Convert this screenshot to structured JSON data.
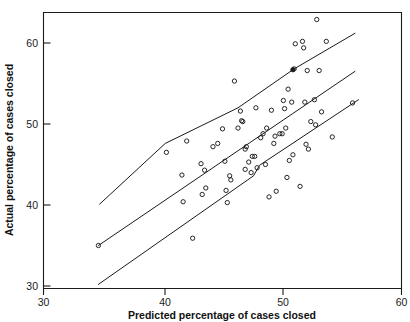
{
  "chart_data": {
    "type": "scatter",
    "title": "",
    "xlabel": "Predicted percentage of cases closed",
    "ylabel": "Actual percentage of cases closed",
    "xlim": [
      30,
      60
    ],
    "ylim": [
      30,
      65
    ],
    "xticks": [
      30,
      40,
      50,
      60
    ],
    "yticks": [
      30,
      40,
      50,
      60
    ],
    "xtick_labels": [
      "30",
      "40",
      "50",
      "60"
    ],
    "ytick_labels": [
      "30",
      "40",
      "50",
      "60"
    ],
    "grid": false,
    "legend": null,
    "marker": "open-circle",
    "points": [
      [
        34.6,
        35.0
      ],
      [
        40.3,
        46.5
      ],
      [
        41.6,
        43.7
      ],
      [
        41.7,
        40.4
      ],
      [
        42.0,
        47.9
      ],
      [
        42.5,
        35.9
      ],
      [
        43.2,
        45.1
      ],
      [
        43.5,
        44.3
      ],
      [
        43.6,
        42.1
      ],
      [
        43.3,
        41.3
      ],
      [
        44.2,
        47.2
      ],
      [
        44.6,
        47.6
      ],
      [
        45.0,
        49.4
      ],
      [
        45.2,
        45.4
      ],
      [
        45.3,
        41.8
      ],
      [
        45.4,
        40.3
      ],
      [
        45.6,
        43.6
      ],
      [
        45.7,
        43.1
      ],
      [
        46.0,
        55.3
      ],
      [
        46.3,
        49.5
      ],
      [
        46.5,
        51.6
      ],
      [
        46.6,
        50.4
      ],
      [
        46.7,
        50.3
      ],
      [
        46.9,
        44.4
      ],
      [
        46.9,
        46.9
      ],
      [
        47.0,
        47.2
      ],
      [
        47.2,
        45.3
      ],
      [
        47.4,
        44.0
      ],
      [
        47.5,
        46.0
      ],
      [
        47.7,
        46.0
      ],
      [
        47.8,
        52.0
      ],
      [
        47.9,
        44.6
      ],
      [
        48.2,
        48.3
      ],
      [
        48.4,
        48.8
      ],
      [
        48.6,
        45.0
      ],
      [
        48.7,
        49.5
      ],
      [
        48.9,
        41.0
      ],
      [
        49.1,
        51.7
      ],
      [
        49.3,
        47.6
      ],
      [
        49.4,
        48.5
      ],
      [
        49.5,
        41.7
      ],
      [
        49.8,
        48.8
      ],
      [
        50.0,
        48.8
      ],
      [
        50.1,
        52.9
      ],
      [
        50.2,
        51.9
      ],
      [
        50.3,
        49.5
      ],
      [
        50.4,
        43.4
      ],
      [
        50.5,
        54.3
      ],
      [
        50.6,
        45.5
      ],
      [
        50.8,
        52.7
      ],
      [
        50.9,
        46.2
      ],
      [
        51.0,
        56.8
      ],
      [
        51.1,
        59.9
      ],
      [
        51.5,
        42.3
      ],
      [
        51.7,
        60.2
      ],
      [
        51.8,
        59.4
      ],
      [
        51.9,
        52.7
      ],
      [
        52.0,
        47.5
      ],
      [
        52.1,
        56.6
      ],
      [
        52.2,
        46.9
      ],
      [
        52.4,
        50.3
      ],
      [
        52.7,
        53.0
      ],
      [
        52.8,
        49.9
      ],
      [
        52.9,
        62.9
      ],
      [
        53.1,
        56.6
      ],
      [
        53.3,
        51.5
      ],
      [
        53.7,
        60.2
      ],
      [
        54.2,
        48.4
      ],
      [
        55.9,
        52.6
      ]
    ],
    "filled_points": [
      [
        50.9,
        56.7
      ]
    ],
    "lines": [
      {
        "name": "upper-band-line",
        "x": [
          34.7,
          40.2,
          46.3,
          51.0,
          56.1
        ],
        "y": [
          40.1,
          47.6,
          52.0,
          56.8,
          61.2
        ]
      },
      {
        "name": "middle-fit-line",
        "x": [
          34.6,
          48.9,
          56.1
        ],
        "y": [
          35.0,
          49.3,
          56.5
        ]
      },
      {
        "name": "lower-band-line",
        "x": [
          34.6,
          47.6,
          48.1,
          56.4
        ],
        "y": [
          30.2,
          43.6,
          44.9,
          53.0
        ]
      }
    ]
  },
  "axes": {
    "x_title": "Predicted percentage of cases closed",
    "y_title": "Actual percentage of cases closed",
    "x_tick_labels": [
      "30",
      "40",
      "50",
      "60"
    ],
    "y_tick_labels": [
      "30",
      "40",
      "50",
      "60"
    ]
  },
  "colors": {
    "ink": "#1a1a1a",
    "background": "#ffffff"
  }
}
